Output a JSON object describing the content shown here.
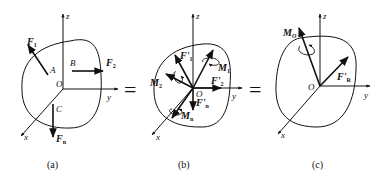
{
  "figure": {
    "panels": [
      {
        "caption": "(a)",
        "axes": {
          "x": "x",
          "y": "y",
          "z": "z",
          "origin": "O"
        },
        "points": [
          "A",
          "B",
          "C"
        ],
        "forces": [
          {
            "label": "F",
            "sub": "1"
          },
          {
            "label": "F",
            "sub": "2"
          },
          {
            "label": "F",
            "sub": "n"
          }
        ]
      },
      {
        "caption": "(b)",
        "axes": {
          "x": "x",
          "y": "y",
          "z": "z",
          "origin": "O"
        },
        "forces": [
          {
            "label": "F'",
            "sub": "1"
          },
          {
            "label": "F'",
            "sub": "2"
          },
          {
            "label": "F'",
            "sub": "n"
          }
        ],
        "moments": [
          {
            "label": "M",
            "sub": "1"
          },
          {
            "label": "M",
            "sub": "2"
          },
          {
            "label": "M",
            "sub": "n"
          }
        ]
      },
      {
        "caption": "(c)",
        "axes": {
          "x": "x",
          "y": "y",
          "z": "z",
          "origin": "O"
        },
        "forces": [
          {
            "label": "F'",
            "sub": "R"
          }
        ],
        "moments": [
          {
            "label": "M",
            "sub": "O"
          }
        ]
      }
    ],
    "equals": [
      "=",
      "="
    ]
  }
}
